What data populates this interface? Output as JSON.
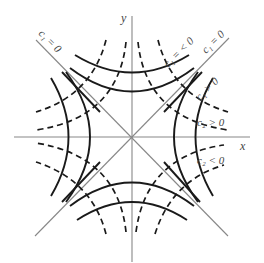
{
  "diagram": {
    "title": "",
    "axes": {
      "x_label": "x",
      "y_label": "y"
    },
    "labels": {
      "c1_zero_left": "c₁ = 0",
      "c1_neg": "c₁ = < 0",
      "c1_zero_right": "c₁ = 0",
      "c1_pos": "c₁ > 0",
      "c2_pos": "c₂ > 0",
      "c2_neg": "c₂ < 0"
    },
    "legend": {
      "solid_curves": "level curves family c1",
      "dashed_curves": "level curves family c2",
      "thin_lines": "asymptotes / axes"
    },
    "colors": {
      "axis": "#888888",
      "curve": "#1a1a1a",
      "text": "#444444"
    }
  }
}
